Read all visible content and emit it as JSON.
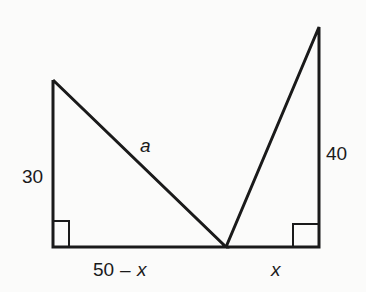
{
  "diagram": {
    "labels": {
      "left_height": "30",
      "hypotenuse": "a",
      "right_height": "40",
      "left_base_num": "50",
      "left_base_op": "–",
      "left_base_var": "x",
      "right_base": "x"
    },
    "colors": {
      "stroke": "#1a1a1a",
      "background": "#fbfbfa"
    }
  }
}
